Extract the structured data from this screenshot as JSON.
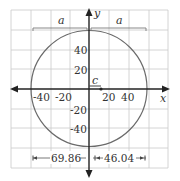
{
  "diagram": {
    "axes": {
      "x_label": "x",
      "y_label": "y"
    },
    "x_ticks": [
      "-40",
      "-20",
      "20",
      "40"
    ],
    "y_ticks": [
      "40",
      "20",
      "-20",
      "-40"
    ],
    "braces": [
      {
        "label": "a",
        "side": "left"
      },
      {
        "label": "a",
        "side": "right"
      }
    ],
    "focus_label": "c",
    "dimensions": {
      "left": "69.86",
      "right": "46.04"
    },
    "colors": {
      "grid": "#c9c9c9",
      "axis": "#222222",
      "curve": "#6a6a6a",
      "text": "#333333"
    }
  }
}
